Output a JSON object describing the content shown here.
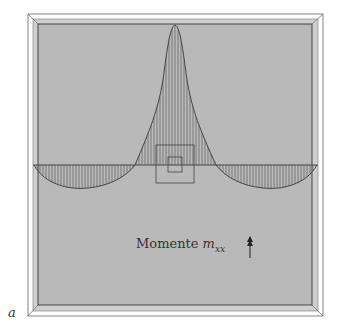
{
  "figure": {
    "label": "a",
    "title_text": "Momente",
    "title_symbol": "m",
    "title_subscript": "xx",
    "arrow_icon": "double-arrow-up-icon"
  },
  "colors": {
    "plate_fill": "#b9b9b9",
    "frame": "#555555",
    "curve": "#444444",
    "hatch": "#666666"
  },
  "diagram": {
    "type": "bending-moment-plot",
    "zero_line_y": 165,
    "peak": {
      "x": 175,
      "y": 25
    },
    "left_trough": {
      "x": 88,
      "y": 188
    },
    "right_trough": {
      "x": 263,
      "y": 188
    }
  }
}
